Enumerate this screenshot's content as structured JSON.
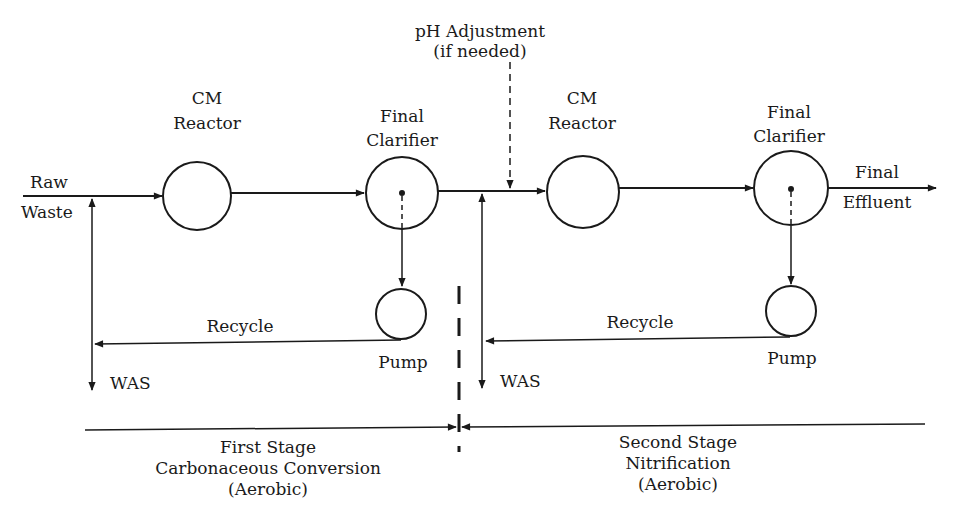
{
  "diagram": {
    "colors": {
      "line": "#1a1a1a",
      "background": "#ffffff"
    },
    "labels": {
      "raw_waste": [
        "Raw",
        "Waste"
      ],
      "ph_adjustment": [
        "pH Adjustment",
        "(if needed)"
      ],
      "final_effluent": [
        "Final",
        "Effluent"
      ]
    },
    "stage1": {
      "reactor": [
        "CM",
        "Reactor"
      ],
      "clarifier": [
        "Final",
        "Clarifier"
      ],
      "recycle": "Recycle",
      "pump": "Pump",
      "was": "WAS",
      "description": [
        "First Stage",
        "Carbonaceous Conversion",
        "(Aerobic)"
      ]
    },
    "stage2": {
      "reactor": [
        "CM",
        "Reactor"
      ],
      "clarifier": [
        "Final",
        "Clarifier"
      ],
      "recycle": "Recycle",
      "pump": "Pump",
      "was": "WAS",
      "description": [
        "Second Stage",
        "Nitrification",
        "(Aerobic)"
      ]
    }
  }
}
